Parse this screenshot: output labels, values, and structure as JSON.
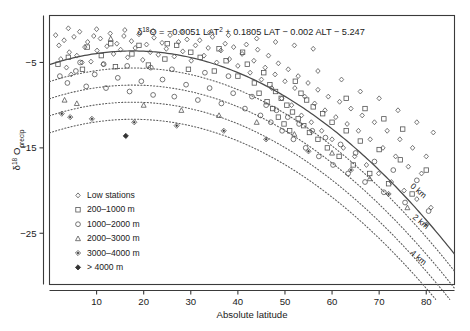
{
  "chart_data": {
    "type": "scatter",
    "title": "",
    "equation": "δ¹⁸O = −0.0051 LAT² + 0.1805 LAT − 0.002 ALT − 5.247",
    "equation_parts": {
      "delta": "δ",
      "delta_sup": "18",
      "o": "O",
      "rest": " = −0.0051 LAT",
      "lat_sup": "2",
      "tail": " + 0.1805 LAT − 0.002 ALT − 5.247"
    },
    "xlabel": "Absolute latitude",
    "ylabel_main": "δ",
    "ylabel_sup": "18",
    "ylabel_o": "O",
    "ylabel_sub": "precip",
    "xlim": [
      0,
      86
    ],
    "ylim": [
      -31,
      0.5
    ],
    "xticks": [
      10,
      20,
      30,
      40,
      50,
      60,
      70,
      80
    ],
    "yticks": [
      -5,
      -15,
      -25
    ],
    "grid": false,
    "legend_position": "lower-left",
    "legend": [
      {
        "marker": "diamond-small",
        "label": "Low stations"
      },
      {
        "marker": "square",
        "label": "200–1000 m"
      },
      {
        "marker": "circle",
        "label": "1000–2000 m"
      },
      {
        "marker": "triangle",
        "label": "2000–3000 m"
      },
      {
        "marker": "diamond-dot",
        "label": "3000–4000 m"
      },
      {
        "marker": "diamond-filled",
        "label": "> 4000 m"
      }
    ],
    "curves": [
      {
        "altitude_m": 0,
        "label": "0 km",
        "style": "solid",
        "label_x": 76.5,
        "label_y": -19.6
      },
      {
        "altitude_m": 1000,
        "label": "",
        "style": "dotted",
        "label_x": 0,
        "label_y": 0
      },
      {
        "altitude_m": 2000,
        "label": "2 km",
        "style": "dotted",
        "label_x": 77.0,
        "label_y": -23.2
      },
      {
        "altitude_m": 3000,
        "label": "",
        "style": "dotted",
        "label_x": 0,
        "label_y": 0
      },
      {
        "altitude_m": 4000,
        "label": "4 km",
        "style": "dotted",
        "label_x": 76.5,
        "label_y": -27.4
      }
    ],
    "curve_formula": {
      "a": -0.0051,
      "b": 0.1805,
      "c": -0.002,
      "d": -5.247
    },
    "series": [
      {
        "name": "Low stations",
        "marker": "diamond-small",
        "points": [
          [
            1.3,
            -1.8
          ],
          [
            2.0,
            -3.0
          ],
          [
            2.4,
            -4.6
          ],
          [
            3.1,
            -2.4
          ],
          [
            3.6,
            -5.6
          ],
          [
            4.2,
            -3.8
          ],
          [
            4.6,
            -6.4
          ],
          [
            5.2,
            -2.0
          ],
          [
            5.8,
            -4.2
          ],
          [
            6.4,
            -1.4
          ],
          [
            6.9,
            -5.0
          ],
          [
            7.5,
            -3.2
          ],
          [
            8.1,
            -2.6
          ],
          [
            8.8,
            -4.9
          ],
          [
            9.4,
            -1.9
          ],
          [
            10.1,
            -3.6
          ],
          [
            10.8,
            -2.2
          ],
          [
            11.4,
            -5.2
          ],
          [
            12.2,
            -3.1
          ],
          [
            12.9,
            -1.6
          ],
          [
            13.6,
            -4.0
          ],
          [
            14.3,
            -2.8
          ],
          [
            15.1,
            -3.5
          ],
          [
            15.8,
            -1.9
          ],
          [
            16.6,
            -4.4
          ],
          [
            17.4,
            -2.5
          ],
          [
            18.2,
            -3.3
          ],
          [
            19.0,
            -1.7
          ],
          [
            19.8,
            -4.7
          ],
          [
            20.6,
            -2.9
          ],
          [
            21.4,
            -3.8
          ],
          [
            22.2,
            -2.1
          ],
          [
            23.1,
            -4.1
          ],
          [
            23.9,
            -2.7
          ],
          [
            24.8,
            -3.4
          ],
          [
            25.6,
            -1.8
          ],
          [
            26.5,
            -4.3
          ],
          [
            27.4,
            -2.6
          ],
          [
            28.3,
            -3.7
          ],
          [
            29.2,
            -2.3
          ],
          [
            30.1,
            -4.8
          ],
          [
            31.0,
            -3.0
          ],
          [
            31.9,
            -2.4
          ],
          [
            32.8,
            -4.2
          ],
          [
            33.7,
            -3.3
          ],
          [
            34.6,
            -2.0
          ],
          [
            35.5,
            -5.0
          ],
          [
            36.4,
            -3.6
          ],
          [
            37.3,
            -2.8
          ],
          [
            38.2,
            -4.6
          ],
          [
            39.1,
            -3.2
          ],
          [
            40.0,
            -5.4
          ],
          [
            40.9,
            -4.0
          ],
          [
            41.8,
            -2.9
          ],
          [
            42.6,
            -6.2
          ],
          [
            43.4,
            -4.8
          ],
          [
            44.2,
            -3.5
          ],
          [
            45.0,
            -7.0
          ],
          [
            45.8,
            -5.6
          ],
          [
            46.5,
            -4.2
          ],
          [
            47.2,
            -8.0
          ],
          [
            47.9,
            -6.4
          ],
          [
            48.6,
            -5.1
          ],
          [
            49.3,
            -9.2
          ],
          [
            50.0,
            -7.2
          ],
          [
            50.7,
            -5.8
          ],
          [
            51.4,
            -10.0
          ],
          [
            52.1,
            -8.0
          ],
          [
            52.8,
            -6.6
          ],
          [
            53.5,
            -11.2
          ],
          [
            54.2,
            -9.0
          ],
          [
            54.9,
            -7.4
          ],
          [
            55.6,
            -12.0
          ],
          [
            56.3,
            -9.8
          ],
          [
            57.0,
            -8.2
          ],
          [
            57.8,
            -13.0
          ],
          [
            58.5,
            -10.6
          ],
          [
            59.2,
            -9.0
          ],
          [
            60.0,
            -14.0
          ],
          [
            60.8,
            -11.4
          ],
          [
            61.6,
            -9.6
          ],
          [
            62.4,
            -15.0
          ],
          [
            63.2,
            -12.2
          ],
          [
            64.0,
            -10.4
          ],
          [
            64.8,
            -16.0
          ],
          [
            65.6,
            -13.0
          ],
          [
            66.4,
            -11.2
          ],
          [
            67.3,
            -17.0
          ],
          [
            68.1,
            -14.0
          ],
          [
            69.0,
            -12.0
          ],
          [
            69.9,
            -18.0
          ],
          [
            70.8,
            -15.0
          ],
          [
            71.7,
            -13.0
          ],
          [
            72.6,
            -19.0
          ],
          [
            73.5,
            -16.0
          ],
          [
            74.4,
            -14.0
          ],
          [
            75.3,
            -20.0
          ],
          [
            76.2,
            -17.2
          ],
          [
            77.1,
            -15.0
          ],
          [
            78.0,
            -21.0
          ],
          [
            79.0,
            -18.0
          ],
          [
            80.0,
            -16.0
          ],
          [
            81.0,
            -22.0
          ],
          [
            57.0,
            -6.0
          ],
          [
            62.0,
            -7.0
          ],
          [
            66.0,
            -8.4
          ],
          [
            70.0,
            -9.2
          ],
          [
            74.0,
            -10.6
          ],
          [
            78.0,
            -12.0
          ],
          [
            81.5,
            -13.2
          ],
          [
            44.0,
            -2.2
          ],
          [
            48.0,
            -2.6
          ],
          [
            52.0,
            -3.0
          ],
          [
            56.0,
            -3.4
          ],
          [
            38.0,
            -1.8
          ],
          [
            34.0,
            -1.5
          ],
          [
            28.0,
            -1.4
          ],
          [
            22.0,
            -1.3
          ],
          [
            16.0,
            -1.2
          ],
          [
            10.0,
            -1.1
          ],
          [
            4.0,
            -1.0
          ]
        ]
      },
      {
        "name": "200–1000 m",
        "marker": "square",
        "points": [
          [
            1.8,
            -5.2
          ],
          [
            4.0,
            -4.4
          ],
          [
            7.0,
            -5.8
          ],
          [
            11.0,
            -4.2
          ],
          [
            14.0,
            -5.5
          ],
          [
            17.5,
            -4.0
          ],
          [
            21.0,
            -5.3
          ],
          [
            24.5,
            -4.6
          ],
          [
            27.0,
            -3.0
          ],
          [
            29.5,
            -5.8
          ],
          [
            32.0,
            -4.4
          ],
          [
            35.0,
            -6.0
          ],
          [
            37.5,
            -4.8
          ],
          [
            40.0,
            -6.6
          ],
          [
            42.0,
            -5.2
          ],
          [
            43.5,
            -7.4
          ],
          [
            44.5,
            -8.6
          ],
          [
            45.5,
            -6.2
          ],
          [
            46.2,
            -9.6
          ],
          [
            46.8,
            -7.6
          ],
          [
            47.4,
            -10.4
          ],
          [
            48.0,
            -8.4
          ],
          [
            48.6,
            -11.4
          ],
          [
            49.2,
            -9.2
          ],
          [
            49.8,
            -12.2
          ],
          [
            50.4,
            -10.0
          ],
          [
            51.0,
            -13.0
          ],
          [
            51.6,
            -10.8
          ],
          [
            52.2,
            -7.2
          ],
          [
            52.8,
            -11.6
          ],
          [
            53.4,
            -8.6
          ],
          [
            54.0,
            -12.4
          ],
          [
            54.6,
            -9.4
          ],
          [
            55.2,
            -13.2
          ],
          [
            56.0,
            -10.2
          ],
          [
            57.0,
            -14.0
          ],
          [
            58.0,
            -11.0
          ],
          [
            59.0,
            -15.0
          ],
          [
            60.0,
            -12.0
          ],
          [
            61.5,
            -16.0
          ],
          [
            63.0,
            -13.0
          ],
          [
            64.5,
            -17.0
          ],
          [
            66.0,
            -14.2
          ],
          [
            68.0,
            -18.0
          ],
          [
            70.0,
            -15.2
          ],
          [
            72.0,
            -19.2
          ],
          [
            74.5,
            -16.4
          ],
          [
            77.0,
            -20.4
          ],
          [
            80.0,
            -17.6
          ],
          [
            41.0,
            -3.8
          ],
          [
            36.0,
            -3.4
          ],
          [
            30.0,
            -3.8
          ],
          [
            25.0,
            -2.8
          ],
          [
            19.0,
            -3.0
          ],
          [
            13.0,
            -2.8
          ],
          [
            8.0,
            -3.2
          ],
          [
            63.0,
            -9.2
          ],
          [
            67.0,
            -10.4
          ],
          [
            71.0,
            -11.6
          ],
          [
            75.0,
            -12.8
          ]
        ]
      },
      {
        "name": "1000–2000 m",
        "marker": "circle",
        "points": [
          [
            2.2,
            -6.6
          ],
          [
            3.8,
            -7.4
          ],
          [
            5.6,
            -6.0
          ],
          [
            7.8,
            -7.8
          ],
          [
            9.6,
            -6.4
          ],
          [
            12.0,
            -8.0
          ],
          [
            14.5,
            -6.8
          ],
          [
            17.0,
            -8.4
          ],
          [
            19.5,
            -7.2
          ],
          [
            22.0,
            -8.8
          ],
          [
            24.0,
            -7.0
          ],
          [
            26.5,
            -9.0
          ],
          [
            29.0,
            -7.6
          ],
          [
            31.5,
            -9.4
          ],
          [
            34.0,
            -8.0
          ],
          [
            36.5,
            -9.8
          ],
          [
            39.0,
            -8.6
          ],
          [
            41.5,
            -10.4
          ],
          [
            43.0,
            -9.0
          ],
          [
            44.8,
            -11.2
          ],
          [
            46.0,
            -10.0
          ],
          [
            47.0,
            -12.0
          ],
          [
            48.2,
            -10.6
          ],
          [
            49.4,
            -13.0
          ],
          [
            50.6,
            -11.4
          ],
          [
            51.8,
            -14.0
          ],
          [
            53.0,
            -12.2
          ],
          [
            54.4,
            -15.0
          ],
          [
            55.8,
            -13.0
          ],
          [
            57.2,
            -16.0
          ],
          [
            58.6,
            -13.8
          ],
          [
            60.2,
            -17.0
          ],
          [
            61.8,
            -14.6
          ],
          [
            63.4,
            -18.0
          ],
          [
            65.0,
            -15.6
          ],
          [
            67.0,
            -19.0
          ],
          [
            69.0,
            -16.6
          ],
          [
            71.0,
            -20.2
          ],
          [
            73.0,
            -17.6
          ],
          [
            75.5,
            -21.4
          ],
          [
            78.0,
            -18.8
          ],
          [
            80.5,
            -22.4
          ],
          [
            6.5,
            -5.0
          ],
          [
            11.5,
            -5.2
          ],
          [
            16.5,
            -5.4
          ],
          [
            21.5,
            -5.6
          ],
          [
            26.0,
            -5.8
          ],
          [
            33.0,
            -6.2
          ],
          [
            38.0,
            -6.6
          ]
        ]
      },
      {
        "name": "2000–3000 m",
        "marker": "triangle",
        "points": [
          [
            3.2,
            -9.4
          ],
          [
            5.8,
            -9.8
          ],
          [
            13.0,
            -2.2
          ],
          [
            20.0,
            -10.0
          ],
          [
            28.0,
            -10.6
          ],
          [
            36.0,
            -11.2
          ],
          [
            44.0,
            -12.0
          ],
          [
            52.0,
            -13.4
          ],
          [
            60.0,
            -15.6
          ],
          [
            68.0,
            -18.6
          ],
          [
            76.0,
            -22.0
          ]
        ]
      },
      {
        "name": "3000–4000 m",
        "marker": "diamond-dot",
        "points": [
          [
            2.6,
            -11.0
          ],
          [
            4.4,
            -11.4
          ],
          [
            9.0,
            -11.6
          ],
          [
            18.0,
            -12.0
          ],
          [
            27.0,
            -12.4
          ],
          [
            37.0,
            -13.0
          ],
          [
            46.0,
            -14.0
          ],
          [
            55.0,
            -15.4
          ],
          [
            64.0,
            -17.6
          ],
          [
            72.0,
            -20.4
          ],
          [
            80.0,
            -24.0
          ]
        ]
      },
      {
        "name": "> 4000 m",
        "marker": "diamond-filled",
        "points": [
          [
            16.2,
            -13.6
          ]
        ]
      }
    ]
  }
}
